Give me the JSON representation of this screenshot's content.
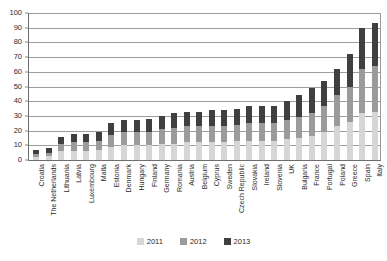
{
  "chart_data": {
    "type": "bar",
    "stacked": true,
    "title": "",
    "subtitle": "",
    "xlabel": "",
    "ylabel": "",
    "ylim": [
      0,
      100
    ],
    "ytick_step": 10,
    "yticks": [
      0,
      10,
      20,
      30,
      40,
      50,
      60,
      70,
      80,
      90,
      100
    ],
    "ytick_labels": [
      "0",
      "10",
      "20",
      "30",
      "40",
      "50",
      "60",
      "70",
      "80",
      "90",
      "100"
    ],
    "grid": "horizontal",
    "legend_position": "bottom-center",
    "categories": [
      "Croatia",
      "The Netherlands",
      "Lithuania",
      "Latvia",
      "Luxembourg",
      "Malta",
      "Estonia",
      "Denmark",
      "Hungary",
      "Finland",
      "Germany",
      "Romania",
      "Austria",
      "Belgium",
      "Cyprus",
      "Sweden",
      "Czech Republic",
      "Slovakia",
      "Ireland",
      "Slovenia",
      "UK",
      "Bulgaria",
      "France",
      "Portugal",
      "Poland",
      "Greece",
      "Spain",
      "Italy"
    ],
    "series": [
      {
        "name": "2011",
        "color": "#d6d6d6",
        "values": [
          2,
          3,
          6,
          6,
          6,
          7,
          9,
          10,
          10,
          10,
          11,
          11,
          12,
          12,
          12,
          12,
          13,
          13,
          13,
          13,
          14,
          15,
          16,
          19,
          23,
          26,
          32,
          33
        ]
      },
      {
        "name": "2012",
        "color": "#9b9b9b",
        "values": [
          2,
          2,
          5,
          6,
          6,
          6,
          8,
          9,
          9,
          9,
          10,
          11,
          11,
          11,
          11,
          11,
          11,
          12,
          12,
          12,
          13,
          14,
          16,
          18,
          21,
          24,
          30,
          31
        ]
      },
      {
        "name": "2013",
        "color": "#3f3f3f",
        "values": [
          3,
          3,
          5,
          6,
          6,
          6,
          8,
          8,
          8,
          9,
          9,
          10,
          10,
          10,
          11,
          11,
          11,
          12,
          12,
          12,
          13,
          15,
          17,
          17,
          18,
          22,
          28,
          29
        ]
      }
    ],
    "totals": [
      7,
      8,
      16,
      18,
      18,
      19,
      25,
      27,
      27,
      28,
      30,
      32,
      33,
      33,
      34,
      34,
      35,
      37,
      37,
      37,
      40,
      44,
      49,
      54,
      62,
      72,
      90,
      93
    ]
  },
  "legend": {
    "items": [
      {
        "label": "2011",
        "color": "#d6d6d6"
      },
      {
        "label": "2012",
        "color": "#9b9b9b"
      },
      {
        "label": "2013",
        "color": "#3f3f3f"
      }
    ]
  }
}
